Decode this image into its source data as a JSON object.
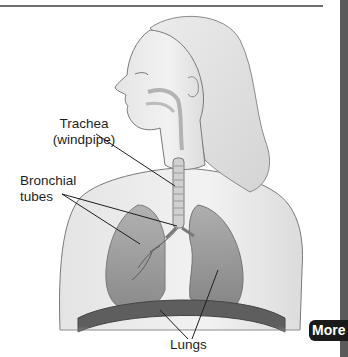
{
  "figure": {
    "labels": {
      "trachea_line1": "Trachea",
      "trachea_line2": "(windpipe)",
      "bronchial_line1": "Bronchial",
      "bronchial_line2": "tubes",
      "lungs": "Lungs"
    }
  },
  "navigation": {
    "more_label": "More"
  },
  "colors": {
    "rule": "#6e6e6e",
    "side_strip": "#5a5a5a",
    "more_button_bg": "#1a1a1a",
    "more_button_text": "#ffffff",
    "label_text": "#1e1e1e"
  }
}
